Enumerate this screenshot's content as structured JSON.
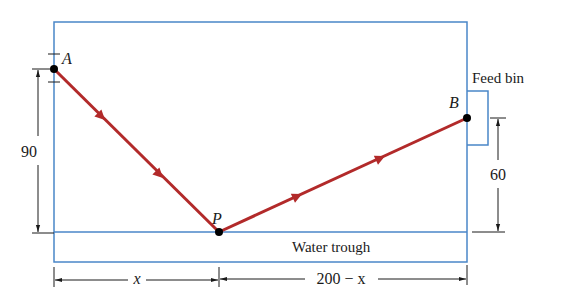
{
  "figure": {
    "points": {
      "A": {
        "label": "A",
        "x": 54,
        "y": 69
      },
      "P": {
        "label": "P",
        "x": 219,
        "y": 232
      },
      "B": {
        "label": "B",
        "x": 467,
        "y": 118
      }
    },
    "labels": {
      "feed_bin": "Feed bin",
      "water_trough": "Water trough",
      "height_A": "90",
      "height_B": "60",
      "segment_left": "x",
      "segment_right": "200 − x"
    },
    "colors": {
      "boundary": "#4a86c8",
      "path": "#b22a2a",
      "dimension": "#1a1a1a",
      "point": "#000000"
    }
  }
}
